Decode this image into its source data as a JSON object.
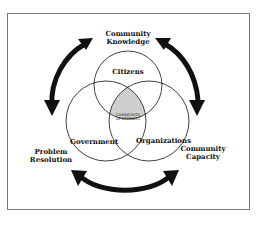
{
  "diagram": {
    "outer_labels": {
      "top": [
        "Community",
        "Knowledge"
      ],
      "left": [
        "Problem",
        "Resolution"
      ],
      "right": [
        "Community",
        "Capacity"
      ]
    },
    "circles": {
      "top": "Citizens",
      "left": "Government",
      "right": "Organizations"
    },
    "center": [
      "COMMUNITY",
      "OF INTEREST"
    ],
    "arrows": [
      {
        "from": "Problem Resolution",
        "to": "Community Knowledge",
        "style": "one-way"
      },
      {
        "from": "Community Knowledge",
        "to": "Community Capacity",
        "style": "two-way"
      },
      {
        "from": "Community Capacity",
        "to": "Problem Resolution",
        "style": "two-way"
      }
    ],
    "colors": {
      "ink": "#111111",
      "frame": "#777777",
      "hatch": "#bbbbbb"
    }
  }
}
